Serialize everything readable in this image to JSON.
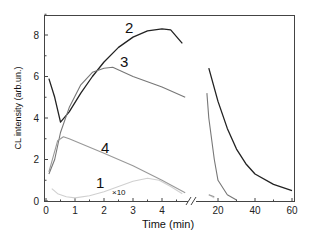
{
  "chart_data": {
    "type": "line",
    "title": "",
    "xlabel": "Time (min)",
    "ylabel": "CL intensity (arb.un.)",
    "ylim": [
      0,
      9
    ],
    "y_ticks": [
      "0",
      "2",
      "4",
      "6",
      "8"
    ],
    "x_axis_broken": true,
    "x_segments": [
      {
        "range": [
          0,
          4.9
        ],
        "ticks": [
          "0",
          "1",
          "2",
          "3",
          "4"
        ]
      },
      {
        "range": [
          10,
          60
        ],
        "ticks": [
          "20",
          "40",
          "60"
        ]
      }
    ],
    "grid": false,
    "legend": "none (inline curve labels)",
    "series": [
      {
        "name": "1",
        "annotation": "×10",
        "color": "#d0d0d0",
        "points": [
          [
            0.2,
            0.6
          ],
          [
            0.4,
            0.35
          ],
          [
            0.7,
            0.2
          ],
          [
            1.0,
            0.15
          ],
          [
            1.5,
            0.25
          ],
          [
            2.0,
            0.45
          ],
          [
            2.5,
            0.7
          ],
          [
            3.0,
            0.95
          ],
          [
            3.5,
            1.1
          ],
          [
            3.9,
            1.0
          ],
          [
            4.3,
            0.7
          ],
          [
            4.7,
            0.35
          ],
          [
            15,
            0.3
          ],
          [
            18,
            0.15
          ]
        ]
      },
      {
        "name": "2",
        "color": "#222222",
        "points": [
          [
            0.1,
            5.9
          ],
          [
            0.3,
            5.0
          ],
          [
            0.5,
            3.8
          ],
          [
            0.8,
            4.3
          ],
          [
            1.2,
            5.2
          ],
          [
            1.6,
            6.0
          ],
          [
            2.0,
            6.7
          ],
          [
            2.5,
            7.4
          ],
          [
            3.0,
            7.9
          ],
          [
            3.5,
            8.2
          ],
          [
            4.0,
            8.3
          ],
          [
            4.3,
            8.25
          ],
          [
            4.7,
            7.6
          ],
          [
            15,
            6.4
          ],
          [
            20,
            4.8
          ],
          [
            25,
            3.5
          ],
          [
            30,
            2.5
          ],
          [
            35,
            1.8
          ],
          [
            40,
            1.3
          ],
          [
            50,
            0.8
          ],
          [
            60,
            0.5
          ]
        ]
      },
      {
        "name": "3",
        "color": "#777777",
        "points": [
          [
            0.1,
            1.3
          ],
          [
            0.3,
            2.0
          ],
          [
            0.5,
            3.3
          ],
          [
            0.8,
            4.5
          ],
          [
            1.2,
            5.6
          ],
          [
            1.6,
            6.2
          ],
          [
            2.0,
            6.4
          ],
          [
            2.3,
            6.45
          ],
          [
            3.0,
            6.0
          ],
          [
            4.0,
            5.5
          ],
          [
            4.8,
            5.0
          ],
          [
            14,
            5.2
          ],
          [
            15,
            4.0
          ],
          [
            18,
            2.0
          ],
          [
            20,
            1.0
          ],
          [
            25,
            0.3
          ],
          [
            30,
            0.05
          ]
        ]
      },
      {
        "name": "4",
        "color": "#999999",
        "points": [
          [
            0.1,
            1.4
          ],
          [
            0.2,
            1.9
          ],
          [
            0.4,
            2.9
          ],
          [
            0.5,
            3.0
          ],
          [
            0.6,
            3.1
          ],
          [
            0.8,
            3.0
          ],
          [
            2.0,
            2.3
          ],
          [
            3.0,
            1.7
          ],
          [
            4.0,
            1.0
          ],
          [
            4.8,
            0.4
          ],
          [
            15,
            0.3
          ],
          [
            18,
            0.2
          ]
        ]
      }
    ]
  },
  "labels": {
    "curve_1": "1",
    "curve_1_scale": "×10",
    "curve_2": "2",
    "curve_3": "3",
    "curve_4": "4",
    "xlabel": "Time (min)",
    "ylabel": "CL intensity (arb.un.)",
    "yticks": [
      "0",
      "2",
      "4",
      "6",
      "8"
    ],
    "xticks_left": [
      "0",
      "1",
      "2",
      "3",
      "4"
    ],
    "xticks_right": [
      "20",
      "40",
      "60"
    ]
  }
}
